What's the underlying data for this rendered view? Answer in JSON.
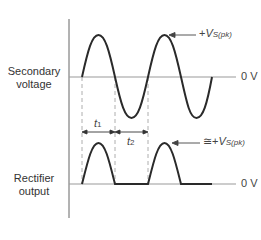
{
  "labels": {
    "secondary_line1": "Secondary",
    "secondary_line2": "voltage",
    "rectifier_line1": "Rectifier",
    "rectifier_line2": "output",
    "zero_v_top": "0 V",
    "zero_v_bottom": "0 V",
    "peak_prefix": "+",
    "peak_symbol": "V",
    "peak_sub": "S(pk)",
    "approx_prefix": "≅+",
    "approx_symbol": "V",
    "approx_sub": "S(pk)",
    "t1": "t",
    "t1_sub": "1",
    "t2": "t",
    "t2_sub": "2"
  },
  "colors": {
    "waveform": "#2a2a2a",
    "axis": "#888888",
    "dashed": "#999999"
  }
}
